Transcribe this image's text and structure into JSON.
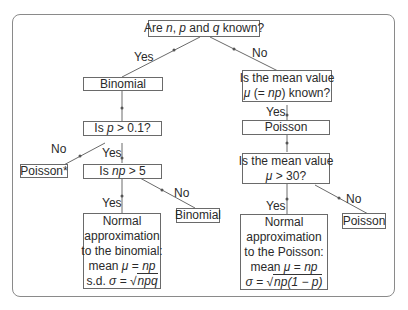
{
  "diagram": {
    "root": {
      "prefix": "Are ",
      "n": "n",
      "sep1": ", ",
      "p": "p",
      "mid": " and ",
      "q": "q",
      "suffix": " known?"
    },
    "left": {
      "binomial": "Binomial",
      "is_p": {
        "prefix": "Is ",
        "var": "p",
        "suffix": " > 0.1?"
      },
      "poisson_star": "Poisson*",
      "is_np": {
        "prefix": "Is ",
        "var": "np",
        "suffix": " > 5"
      },
      "binomial2": "Binomial",
      "normal": {
        "line1": "Normal",
        "line2": "approximation",
        "line3": "to the binomial:",
        "line4_prefix": "mean ",
        "line4_mu": "μ",
        "line4_eq": " = ",
        "line4_val": "np",
        "line5_prefix": "s.d. ",
        "line5_sigma": "σ",
        "line5_eq": " = √",
        "line5_val": "npq"
      }
    },
    "right": {
      "is_mean_known": {
        "line1": "Is the mean value",
        "mu": "μ",
        "paren_open": " (= ",
        "np": "np",
        "paren_close": ") known?"
      },
      "poisson": "Poisson",
      "is_mean_30": {
        "line1": "Is the mean value",
        "mu": "μ",
        "suffix": " > 30?"
      },
      "poisson2": "Poisson",
      "normal": {
        "line1": "Normal",
        "line2": "approximation",
        "line3": "to the Poisson:",
        "line4_prefix": "mean ",
        "line4_mu": "μ",
        "line4_eq": " = ",
        "line4_val": "np",
        "line5_sigma": "σ",
        "line5_eq": " = √",
        "line5_val": "np(1 − p)"
      }
    },
    "labels": {
      "yes": "Yes",
      "no": "No"
    }
  }
}
